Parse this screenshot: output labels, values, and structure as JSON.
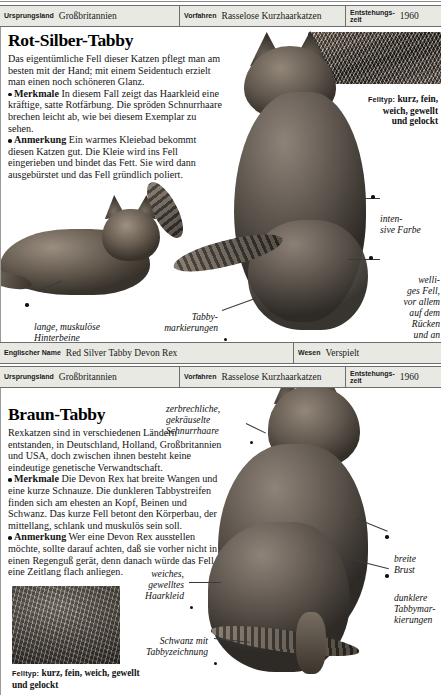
{
  "document": {
    "kind": "encyclopedia-page",
    "language": "de"
  },
  "articles": [
    {
      "id": "rot-silber-tabby",
      "infobar": {
        "fields": [
          {
            "label": "Ursprungsland",
            "value": "Großbritannien"
          },
          {
            "label": "Vorfahren",
            "value": "Rasselose Kurzhaarkatzen"
          },
          {
            "label": "Entstehungs-\nzeit",
            "value": "1960"
          }
        ]
      },
      "title": "Rot-Silber-Tabby",
      "paragraphs": [
        {
          "lead": "",
          "text": "Das eigentümliche Fell dieser Katzen pflegt man am besten mit der Hand; mit einem Seidentuch erzielt man einen noch schöneren Glanz."
        },
        {
          "lead": "Merkmale",
          "text": "In diesem Fall zeigt das Haarkleid eine kräftige, satte Rotfärbung. Die spröden Schnurrhaare brechen leicht ab, wie bei diesem Exemplar zu sehen."
        },
        {
          "lead": "Anmerkung",
          "text": "Ein warmes Kleiebad bekommt diesen Katzen gut. Die Kleie wird ins Fell eingerieben und bindet das Fett. Sie wird dann ausgebürstet und das Fell gründlich poliert."
        }
      ],
      "felltyp": {
        "caption": "Felltyp:",
        "value": "kurz, fein, weich, gewellt und gelockt"
      },
      "callouts": [
        {
          "id": "intensive-farbe",
          "text": "inten-\nsive Farbe",
          "align": "left"
        },
        {
          "id": "welliges-fell",
          "text": "welli-\nges Fell,\nvor allem\nauf dem\nRücken\nund an\nden Seiten",
          "align": "left"
        },
        {
          "id": "hinterbeine",
          "text": "lange, muskulöse\nHinterbeine",
          "align": "left"
        },
        {
          "id": "tabbymarkierungen",
          "text": "Tabby-\nmarkierungen",
          "align": "right"
        }
      ],
      "footerbar": {
        "fields": [
          {
            "label": "Englischer Name",
            "value": "Red Silver Tabby Devon Rex"
          },
          {
            "label": "Wesen",
            "value": "Verspielt"
          }
        ]
      }
    },
    {
      "id": "braun-tabby",
      "infobar": {
        "fields": [
          {
            "label": "Ursprungsland",
            "value": "Großbritannien"
          },
          {
            "label": "Vorfahren",
            "value": "Rasselose Kurzhaarkatzen"
          },
          {
            "label": "Entstehungs-\nzeit",
            "value": "1960"
          }
        ]
      },
      "title": "Braun-Tabby",
      "paragraphs": [
        {
          "lead": "",
          "text": "Rexkatzen sind in verschiedenen Ländern entstanden, in Deutschland, Holland, Großbritannien und USA, doch zwischen ihnen besteht keine eindeutige genetische Verwandtschaft."
        },
        {
          "lead": "Merkmale",
          "text": "Die Devon Rex hat breite Wangen und eine kurze Schnauze. Die dunkleren Tabbystreifen finden sich am ehesten an Kopf, Beinen und Schwanz. Das kurze Fell betont den Körperbau, der mittellang, schlank und muskulös sein soll."
        },
        {
          "lead": "Anmerkung",
          "text": "Wer eine Devon Rex ausstellen möchte, sollte darauf achten, daß sie vorher nicht in einen Regenguß gerät, denn danach würde das Fell eine Zeitlang flach anliegen."
        }
      ],
      "felltyp": {
        "caption": "Felltyp:",
        "value": "kurz, fein, weich, gewellt und gelockt"
      },
      "callouts": [
        {
          "id": "schnurrhaare",
          "text": "zerbrechliche,\ngekräuselte\nSchnurrhaare",
          "align": "left"
        },
        {
          "id": "breite-brust",
          "text": "breite\nBrust",
          "align": "left"
        },
        {
          "id": "dunklere-tabbymarkierungen",
          "text": "dunklere\nTabbymar-\nkierungen",
          "align": "left"
        },
        {
          "id": "haarkleid",
          "text": "weiches,\ngewelltes\nHaarkleid",
          "align": "right"
        },
        {
          "id": "schwanz",
          "text": "Schwanz mit\nTabbyzeichnung",
          "align": "right"
        }
      ]
    }
  ],
  "colors": {
    "bar_background": "#e9e9e4",
    "bar_rule": "#6d6d6d",
    "text": "#111111",
    "page": "#ffffff"
  }
}
